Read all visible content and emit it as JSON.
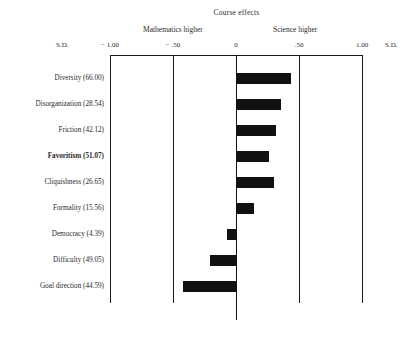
{
  "chart_data": {
    "type": "bar",
    "orientation": "horizontal",
    "title": "Course effects",
    "xlabel": "S.D.",
    "ylabel": "",
    "xlim": [
      -1.0,
      1.0
    ],
    "grid": true,
    "legend": "none",
    "axis_end_label_left": "S.D.",
    "axis_end_label_right": "S.D.",
    "direction_label_negative": "Mathematics higher",
    "direction_label_positive": "Science higher",
    "tick_labels": [
      "− 1.00",
      "− .50",
      "0",
      ".50",
      "1.00"
    ],
    "tick_values": [
      -1.0,
      -0.5,
      0,
      0.5,
      1.0
    ],
    "categories": [
      "Diversity (66.00)",
      "Disorganization (28.54)",
      "Friction (42.12)",
      "Favoritism (51.07)",
      "Cliquishness (26.65)",
      "Formality (15.56)",
      "Democracy (4.39)",
      "Difficulty (49.05)",
      "Goal direction (44.59)"
    ],
    "values": [
      0.44,
      0.36,
      0.32,
      0.26,
      0.3,
      0.14,
      -0.07,
      -0.21,
      -0.42
    ],
    "bold_categories": [
      "Favoritism (51.07)"
    ],
    "bar_color": "#111111"
  }
}
